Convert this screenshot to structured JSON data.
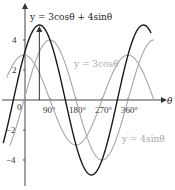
{
  "chart_data": {
    "type": "line",
    "title": "",
    "xlabel": "θ",
    "ylabel": "y",
    "x_unit": "degrees",
    "xlim": [
      -90,
      450
    ],
    "ylim": [
      -5,
      5
    ],
    "x_ticks": [
      {
        "value": 0,
        "label": "0"
      },
      {
        "value": 90,
        "label": "90°"
      },
      {
        "value": 180,
        "label": "180°"
      },
      {
        "value": 270,
        "label": "270°"
      },
      {
        "value": 360,
        "label": "360°"
      }
    ],
    "y_ticks": [
      {
        "value": 4,
        "label": "4"
      },
      {
        "value": 2,
        "label": "2"
      },
      {
        "value": -2,
        "label": "−2"
      },
      {
        "value": -4,
        "label": "−4"
      }
    ],
    "grid": false,
    "series": [
      {
        "name": "y = 3cosθ + 4sinθ",
        "formula": "3cos(θ)+4sin(θ)",
        "amplitude": 5,
        "color": "#1a1a1a",
        "label": "y = 3cosθ + 4sinθ"
      },
      {
        "name": "y = 3cosθ",
        "formula": "3cos(θ)",
        "amplitude": 3,
        "color": "#a6a6a6",
        "label": "y = 3cosθ"
      },
      {
        "name": "y = 4sinθ",
        "formula": "4sin(θ)",
        "amplitude": 4,
        "color": "#a6a6a6",
        "label": "y = 4sinθ"
      }
    ],
    "annotations": [
      {
        "type": "vertical-arrow",
        "x": 53.13,
        "y_from": 0,
        "y_to": 5,
        "note": "maximum of 5 at θ ≈ 53.1°"
      }
    ]
  }
}
